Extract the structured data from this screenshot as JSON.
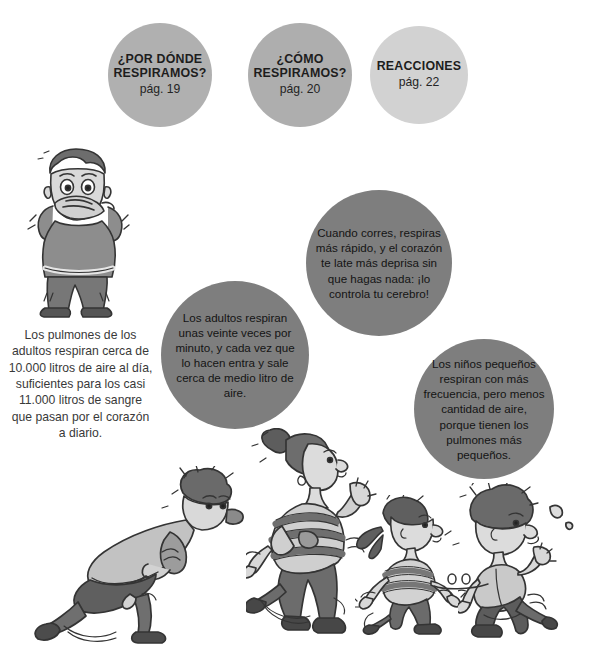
{
  "page": {
    "background_color": "#ffffff",
    "width": 595,
    "height": 658
  },
  "nav_circles": [
    {
      "id": "por-donde-respiramos",
      "title": "¿POR DÓNDE RESPIRAMOS?",
      "page_label": "pág. 19",
      "color": "#b0b0b0"
    },
    {
      "id": "como-respiramos",
      "title": "¿CÓMO RESPIRAMOS?",
      "page_label": "pág. 20",
      "color": "#aeaeae"
    },
    {
      "id": "reacciones",
      "title": "REACCIONES",
      "page_label": "pág. 22",
      "color": "#d2d2d2"
    }
  ],
  "fact_circles": [
    {
      "id": "cuando-corres",
      "text": "Cuando corres, respiras más rápido, y el corazón te late más deprisa sin que hagas nada: ¡lo controla tu cerebro!",
      "color": "#7e7e7e"
    },
    {
      "id": "los-adultos",
      "text": "Los adultos respiran unas veinte veces por minuto, y cada vez que lo hacen entra y sale cerca de medio litro de aire.",
      "color": "#7e7e7e"
    },
    {
      "id": "los-ninos",
      "text": "Los niños pequeños respiran con más frecuencia, pero menos cantidad de aire, porque tienen los pulmones más pequeños.",
      "color": "#7e7e7e"
    }
  ],
  "side_paragraph": {
    "id": "pulmones-adultos",
    "text": "Los pulmones de los adultos respiran cerca de 10.000 litros de aire al día, suficientes para los casi 11.000 litros de sangre que pasan por el corazón a diario.",
    "color": "#393939"
  },
  "illustrations": [
    {
      "id": "boy-covering-mouth",
      "name": "boy-hands-to-mouth-illustration",
      "description": "Niño de pie con las manos en la boca"
    },
    {
      "id": "running-boy-leaning",
      "name": "running-boy-leaning-illustration",
      "description": "Niño corriendo inclinado hacia delante"
    },
    {
      "id": "running-woman-striped",
      "name": "running-woman-striped-shirt-illustration",
      "description": "Mujer corriendo con camiseta de rayas y moño"
    },
    {
      "id": "running-little-girl",
      "name": "running-little-girl-illustration",
      "description": "Niña pequeña corriendo con coletas"
    },
    {
      "id": "running-boy-right",
      "name": "running-boy-illustration",
      "description": "Niño corriendo a la derecha"
    }
  ],
  "palette": {
    "ink_dark": "#2f2f2f",
    "ink_mid": "#6f6f6f",
    "ink_light": "#a9a9a9",
    "skin": "#d8d8d8",
    "cloth_light": "#c7c7c7",
    "cloth_mid": "#9a9a9a",
    "cloth_dark": "#6a6a6a"
  }
}
